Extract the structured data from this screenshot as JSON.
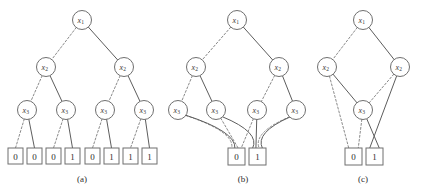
{
  "figure": {
    "background_color": "#ffffff",
    "node_stroke_color": "#6f6f6f",
    "low_edge_color": "#8a8a8a",
    "high_edge_color": "#5d5d5d",
    "low_edge_style": "dashed",
    "high_edge_style": "solid",
    "variable_order": [
      "x1",
      "x2",
      "x3"
    ],
    "panels": [
      {
        "id": "a",
        "caption": "(a)",
        "description": "full binary decision tree",
        "nodes": [
          {
            "id": "a-x1",
            "label_base": "x",
            "label_sub": "1",
            "cx": 82,
            "cy": 20,
            "r": 9.5
          },
          {
            "id": "a-x2-l",
            "label_base": "x",
            "label_sub": "2",
            "cx": 46,
            "cy": 67,
            "r": 9.5
          },
          {
            "id": "a-x2-r",
            "label_base": "x",
            "label_sub": "2",
            "cx": 124,
            "cy": 67,
            "r": 9.5
          },
          {
            "id": "a-x3-1",
            "label_base": "x",
            "label_sub": "3",
            "cx": 27,
            "cy": 110,
            "r": 9.5
          },
          {
            "id": "a-x3-2",
            "label_base": "x",
            "label_sub": "3",
            "cx": 66,
            "cy": 110,
            "r": 9.5
          },
          {
            "id": "a-x3-3",
            "label_base": "x",
            "label_sub": "3",
            "cx": 105,
            "cy": 110,
            "r": 9.5
          },
          {
            "id": "a-x3-4",
            "label_base": "x",
            "label_sub": "3",
            "cx": 144,
            "cy": 110,
            "r": 9.5
          }
        ],
        "terminals": [
          {
            "id": "a-t0",
            "value": "0",
            "x": 8,
            "y": 148,
            "w": 15,
            "h": 16
          },
          {
            "id": "a-t1",
            "value": "0",
            "x": 27,
            "y": 148,
            "w": 15,
            "h": 16
          },
          {
            "id": "a-t2",
            "value": "0",
            "x": 46,
            "y": 148,
            "w": 15,
            "h": 16
          },
          {
            "id": "a-t3",
            "value": "1",
            "x": 65,
            "y": 148,
            "w": 15,
            "h": 16
          },
          {
            "id": "a-t4",
            "value": "0",
            "x": 85,
            "y": 148,
            "w": 15,
            "h": 16
          },
          {
            "id": "a-t5",
            "value": "1",
            "x": 104,
            "y": 148,
            "w": 15,
            "h": 16
          },
          {
            "id": "a-t6",
            "value": "1",
            "x": 123,
            "y": 148,
            "w": 15,
            "h": 16
          },
          {
            "id": "a-t7",
            "value": "1",
            "x": 142,
            "y": 148,
            "w": 15,
            "h": 16
          }
        ],
        "edges": [
          {
            "from": "a-x1",
            "to": "a-x2-l",
            "branch": "low"
          },
          {
            "from": "a-x1",
            "to": "a-x2-r",
            "branch": "high"
          },
          {
            "from": "a-x2-l",
            "to": "a-x3-1",
            "branch": "low"
          },
          {
            "from": "a-x2-l",
            "to": "a-x3-2",
            "branch": "high"
          },
          {
            "from": "a-x2-r",
            "to": "a-x3-3",
            "branch": "low"
          },
          {
            "from": "a-x2-r",
            "to": "a-x3-4",
            "branch": "high"
          },
          {
            "from": "a-x3-1",
            "to": "a-t0",
            "branch": "low"
          },
          {
            "from": "a-x3-1",
            "to": "a-t1",
            "branch": "high"
          },
          {
            "from": "a-x3-2",
            "to": "a-t2",
            "branch": "low"
          },
          {
            "from": "a-x3-2",
            "to": "a-t3",
            "branch": "high"
          },
          {
            "from": "a-x3-3",
            "to": "a-t4",
            "branch": "low"
          },
          {
            "from": "a-x3-3",
            "to": "a-t5",
            "branch": "high"
          },
          {
            "from": "a-x3-4",
            "to": "a-t6",
            "branch": "low"
          },
          {
            "from": "a-x3-4",
            "to": "a-t7",
            "branch": "high"
          }
        ],
        "caption_x": 82,
        "caption_y": 179
      },
      {
        "id": "b",
        "caption": "(b)",
        "description": "decision diagram with merged terminals",
        "nodes": [
          {
            "id": "b-x1",
            "label_base": "x",
            "label_sub": "1",
            "cx": 237,
            "cy": 20,
            "r": 9.5
          },
          {
            "id": "b-x2-l",
            "label_base": "x",
            "label_sub": "2",
            "cx": 196,
            "cy": 67,
            "r": 9.5
          },
          {
            "id": "b-x2-r",
            "label_base": "x",
            "label_sub": "2",
            "cx": 279,
            "cy": 67,
            "r": 9.5
          },
          {
            "id": "b-x3-1",
            "label_base": "x",
            "label_sub": "3",
            "cx": 178,
            "cy": 110,
            "r": 9.5
          },
          {
            "id": "b-x3-2",
            "label_base": "x",
            "label_sub": "3",
            "cx": 216,
            "cy": 110,
            "r": 9.5
          },
          {
            "id": "b-x3-3",
            "label_base": "x",
            "label_sub": "3",
            "cx": 257,
            "cy": 110,
            "r": 9.5
          },
          {
            "id": "b-x3-4",
            "label_base": "x",
            "label_sub": "3",
            "cx": 296,
            "cy": 110,
            "r": 9.5
          }
        ],
        "terminals": [
          {
            "id": "b-t0",
            "value": "0",
            "x": 228,
            "y": 148,
            "w": 17,
            "h": 17
          },
          {
            "id": "b-t1",
            "value": "1",
            "x": 249,
            "y": 148,
            "w": 17,
            "h": 17
          }
        ],
        "edges": [
          {
            "from": "b-x1",
            "to": "b-x2-l",
            "branch": "low"
          },
          {
            "from": "b-x1",
            "to": "b-x2-r",
            "branch": "high"
          },
          {
            "from": "b-x2-l",
            "to": "b-x3-1",
            "branch": "low"
          },
          {
            "from": "b-x2-l",
            "to": "b-x3-2",
            "branch": "high"
          },
          {
            "from": "b-x2-r",
            "to": "b-x3-3",
            "branch": "low"
          },
          {
            "from": "b-x2-r",
            "to": "b-x3-4",
            "branch": "high"
          },
          {
            "from": "b-x3-1",
            "to": "b-t0",
            "branch": "low"
          },
          {
            "from": "b-x3-1",
            "to": "b-t0",
            "branch": "high"
          },
          {
            "from": "b-x3-2",
            "to": "b-t0",
            "branch": "low"
          },
          {
            "from": "b-x3-2",
            "to": "b-t1",
            "branch": "high"
          },
          {
            "from": "b-x3-3",
            "to": "b-t0",
            "branch": "low"
          },
          {
            "from": "b-x3-3",
            "to": "b-t1",
            "branch": "high"
          },
          {
            "from": "b-x3-4",
            "to": "b-t1",
            "branch": "low"
          },
          {
            "from": "b-x3-4",
            "to": "b-t1",
            "branch": "high"
          }
        ],
        "caption_x": 243,
        "caption_y": 179
      },
      {
        "id": "c",
        "caption": "(c)",
        "description": "reduced ordered binary decision diagram",
        "nodes": [
          {
            "id": "c-x1",
            "label_base": "x",
            "label_sub": "1",
            "cx": 363,
            "cy": 20,
            "r": 9.5
          },
          {
            "id": "c-x2-l",
            "label_base": "x",
            "label_sub": "2",
            "cx": 327,
            "cy": 67,
            "r": 9.5
          },
          {
            "id": "c-x2-r",
            "label_base": "x",
            "label_sub": "2",
            "cx": 400,
            "cy": 67,
            "r": 9.5
          },
          {
            "id": "c-x3",
            "label_base": "x",
            "label_sub": "3",
            "cx": 363,
            "cy": 110,
            "r": 9.5
          }
        ],
        "terminals": [
          {
            "id": "c-t0",
            "value": "0",
            "x": 345,
            "y": 148,
            "w": 17,
            "h": 17
          },
          {
            "id": "c-t1",
            "value": "1",
            "x": 366,
            "y": 148,
            "w": 17,
            "h": 17
          }
        ],
        "edges": [
          {
            "from": "c-x1",
            "to": "c-x2-l",
            "branch": "low"
          },
          {
            "from": "c-x1",
            "to": "c-x2-r",
            "branch": "high"
          },
          {
            "from": "c-x2-l",
            "to": "c-t0",
            "branch": "low"
          },
          {
            "from": "c-x2-l",
            "to": "c-x3",
            "branch": "high"
          },
          {
            "from": "c-x2-r",
            "to": "c-x3",
            "branch": "low"
          },
          {
            "from": "c-x2-r",
            "to": "c-t1",
            "branch": "high"
          },
          {
            "from": "c-x3",
            "to": "c-t0",
            "branch": "low"
          },
          {
            "from": "c-x3",
            "to": "c-t1",
            "branch": "high"
          }
        ],
        "caption_x": 363,
        "caption_y": 179
      }
    ]
  }
}
